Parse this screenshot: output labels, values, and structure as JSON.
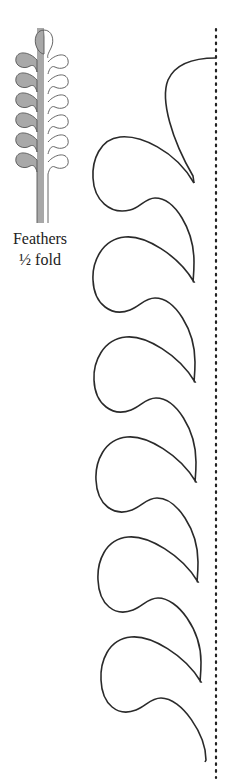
{
  "caption": {
    "line1": "Feathers",
    "line2": "½ fold"
  },
  "colors": {
    "stroke": "#2a2a2a",
    "fill_gray": "#a8a8a8",
    "dotted_line": "#222222"
  },
  "pattern": {
    "fold_line_x": 216,
    "fold_line_top": 29,
    "fold_line_bottom": 778,
    "feather_count": 7,
    "feather_period": 100
  }
}
